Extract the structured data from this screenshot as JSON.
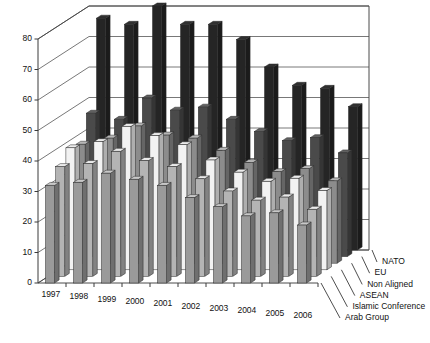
{
  "chart_data": {
    "type": "bar",
    "subtype": "3d-grouped-bar",
    "title": "",
    "subtitle": "",
    "xlabel": "",
    "ylabel": "",
    "ylim": [
      0,
      80
    ],
    "ytick_step": 10,
    "yticks": [
      "0",
      "10",
      "20",
      "30",
      "40",
      "50",
      "60",
      "70",
      "80"
    ],
    "grid": true,
    "legend_position": "right-depth-axis",
    "categories": [
      "1997",
      "1998",
      "1999",
      "2000",
      "2001",
      "2002",
      "2003",
      "2004",
      "2005",
      "2006"
    ],
    "series": [
      {
        "name": "NATO",
        "color": "#252525",
        "values": [
          76,
          74,
          80,
          74,
          74,
          69,
          60,
          54,
          53,
          47
        ]
      },
      {
        "name": "EU",
        "color": "#4a4a4a",
        "values": [
          47,
          45,
          52,
          48,
          49,
          45,
          41,
          38,
          39,
          34
        ]
      },
      {
        "name": "Non Aligned",
        "color": "#8c8c8c",
        "values": [
          39,
          41,
          45,
          42,
          41,
          37,
          33,
          30,
          31,
          27
        ]
      },
      {
        "name": "ASEAN",
        "color": "#f2f2f2",
        "values": [
          40,
          42,
          47,
          44,
          41,
          36,
          32,
          29,
          30,
          26
        ]
      },
      {
        "name": "Islamic Conference",
        "color": "#b4b4b4",
        "values": [
          36,
          37,
          41,
          38,
          36,
          32,
          28,
          25,
          26,
          22
        ]
      },
      {
        "name": "Arab Group",
        "color": "#9a9a9a",
        "values": [
          32,
          33,
          36,
          34,
          32,
          28,
          25,
          22,
          23,
          19
        ]
      }
    ]
  },
  "legend": {
    "entries": [
      "NATO",
      "EU",
      "Non Aligned",
      "ASEAN",
      "Islamic Conference",
      "Arab Group"
    ]
  },
  "axes": {
    "y_tick_labels": [
      "0",
      "10",
      "20",
      "30",
      "40",
      "50",
      "60",
      "70",
      "80"
    ],
    "x_tick_labels": [
      "1997",
      "1998",
      "1999",
      "2000",
      "2001",
      "2002",
      "2003",
      "2004",
      "2005",
      "2006"
    ]
  }
}
